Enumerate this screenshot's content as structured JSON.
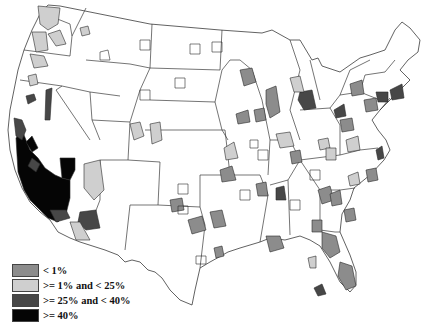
{
  "map": {
    "type": "choropleth",
    "region": "Contiguous United States (metropolitan/county areas)",
    "colors": {
      "none": "#ffffff",
      "lt_1": "#8c8c8c",
      "1_to_25": "#cfcfcf",
      "25_to_40": "#474747",
      "gte_40": "#050505",
      "border": "#2a2a2a"
    },
    "highlights": {
      "gte_40": [
        "California (central/south coast and valley)",
        "Southern Nevada (Las Vegas area)"
      ],
      "25_to_40": [
        "Northern California",
        "Western Nevada",
        "Southern Arizona",
        "Memphis area",
        "Detroit area",
        "Cleveland area",
        "New England (Massachusetts/Connecticut)",
        "Southwest Florida"
      ],
      "1_to_25": [
        "Washington",
        "Oregon",
        "Utah",
        "Arizona",
        "Colorado",
        "Missouri",
        "Virginia",
        "Pennsylvania"
      ],
      "lt_1": [
        "Minnesota",
        "Iowa",
        "Kansas",
        "Oklahoma",
        "Texas",
        "Georgia",
        "Florida",
        "Carolinas",
        "Wisconsin",
        "Michigan",
        "New York"
      ]
    }
  },
  "legend": {
    "items": [
      {
        "label": "< 1%",
        "color": "#8c8c8c"
      },
      {
        "label": ">= 1% and < 25%",
        "color": "#cfcfcf"
      },
      {
        "label": ">= 25% and < 40%",
        "color": "#474747"
      },
      {
        "label": ">= 40%",
        "color": "#050505"
      }
    ]
  }
}
